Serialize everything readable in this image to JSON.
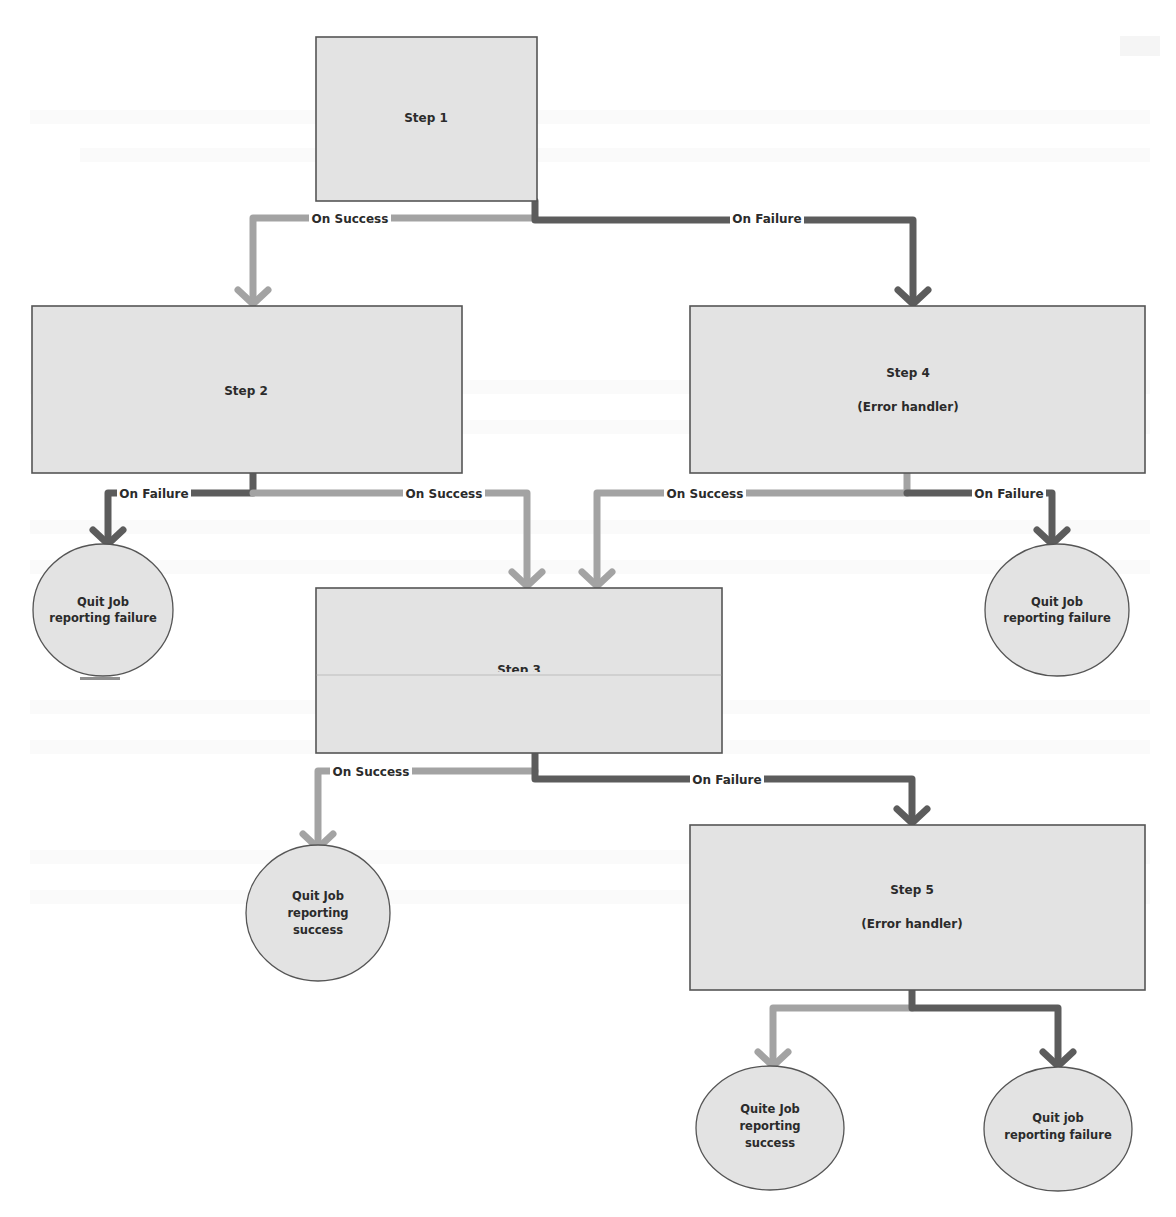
{
  "diagram": {
    "type": "job-step-flowchart",
    "colors": {
      "node_fill": "#e3e3e3",
      "node_stroke": "#555555",
      "success_connector": "#a3a3a3",
      "failure_connector": "#5c5c5c",
      "text": "#2b2b2b"
    },
    "nodes": {
      "step1": {
        "label": "Step 1",
        "sublabel": ""
      },
      "step2": {
        "label": "Step 2",
        "sublabel": ""
      },
      "step4": {
        "label": "Step 4",
        "sublabel": "(Error handler)"
      },
      "step3": {
        "label": "Step 3",
        "sublabel": ""
      },
      "step5": {
        "label": "Step 5",
        "sublabel": "(Error handler)"
      },
      "quit_fail_left": {
        "line1": "Quit Job",
        "line2": "reporting failure",
        "line3": ""
      },
      "quit_fail_right": {
        "line1": "Quit Job",
        "line2": "reporting failure",
        "line3": ""
      },
      "quit_success_mid": {
        "line1": "Quit Job",
        "line2": "reporting",
        "line3": "success"
      },
      "quit_success_bottom": {
        "line1": "Quite Job",
        "line2": "reporting",
        "line3": "success"
      },
      "quit_fail_bottom": {
        "line1": "Quit job",
        "line2": "reporting failure",
        "line3": ""
      }
    },
    "edges": {
      "s1_success": {
        "label": "On Success",
        "from": "Step 1",
        "to": "Step 2"
      },
      "s1_failure": {
        "label": "On Failure",
        "from": "Step 1",
        "to": "Step 4"
      },
      "s2_failure": {
        "label": "On Failure",
        "from": "Step 2",
        "to": "Quit Job reporting failure"
      },
      "s2_success": {
        "label": "On Success",
        "from": "Step 2",
        "to": "Step 3"
      },
      "s4_success": {
        "label": "On Success",
        "from": "Step 4",
        "to": "Step 3"
      },
      "s4_failure": {
        "label": "On Failure",
        "from": "Step 4",
        "to": "Quit Job reporting failure"
      },
      "s3_success": {
        "label": "On Success",
        "from": "Step 3",
        "to": "Quit Job reporting success"
      },
      "s3_failure": {
        "label": "On Failure",
        "from": "Step 3",
        "to": "Step 5"
      },
      "s5_success": {
        "label": "",
        "from": "Step 5",
        "to": "Quite Job reporting success"
      },
      "s5_failure": {
        "label": "",
        "from": "Step 5",
        "to": "Quit job reporting failure"
      }
    }
  }
}
